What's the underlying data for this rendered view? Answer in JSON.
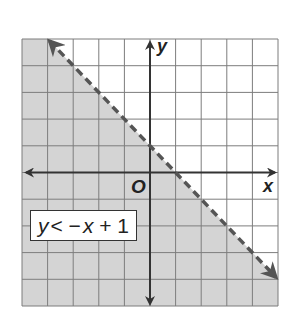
{
  "chart_data": {
    "type": "area",
    "title": "",
    "inequality": "y < −x + 1",
    "boundary_line": {
      "slope": -1,
      "intercept": 1,
      "style": "dashed",
      "points": [
        [
          -4,
          5
        ],
        [
          5,
          -4
        ]
      ]
    },
    "shaded_region": "below line",
    "xlabel": "x",
    "ylabel": "y",
    "origin_label": "O",
    "xlim": [
      -5,
      5
    ],
    "ylim": [
      -5,
      5
    ],
    "grid": true,
    "grid_step": 1
  },
  "labels": {
    "x_axis": "x",
    "y_axis": "y",
    "origin": "O",
    "inequality_y": "y",
    "inequality_rest": "< −",
    "inequality_x": "x",
    "inequality_tail": " + 1"
  },
  "colors": {
    "shade": "#d4d4d4",
    "grid": "#7d7d7d",
    "axis": "#333333",
    "boundary": "#555555"
  }
}
